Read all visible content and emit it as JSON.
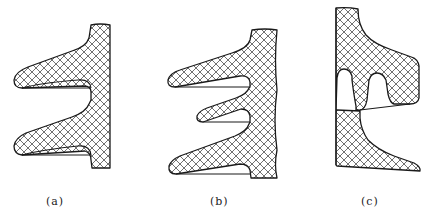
{
  "figure": {
    "hatch_color": "#333333",
    "outline_color": "#1a1a1a",
    "panels": [
      {
        "id": "a",
        "label": "(a)",
        "shed_count": 2
      },
      {
        "id": "b",
        "label": "(b)",
        "shed_count": 3
      },
      {
        "id": "c",
        "label": "(c)",
        "shed_count": 1
      }
    ]
  }
}
